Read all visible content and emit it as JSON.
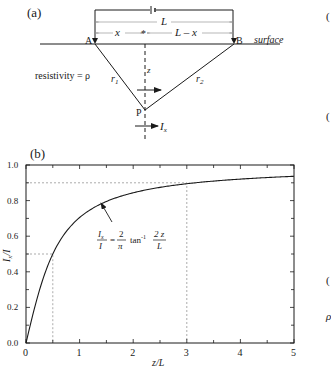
{
  "panel_a": {
    "label": "(a)",
    "L_label": "L",
    "x_label": "x",
    "Lx_label": "L – x",
    "A_label": "A",
    "B_label": "B",
    "surface_label": "surface",
    "resistivity_label": "resistivity = ρ",
    "r1_label": "r",
    "r1_sub": "1",
    "r2_label": "r",
    "r2_sub": "2",
    "z_label": "z",
    "P_label": "P",
    "Ix_label": "I",
    "Ix_sub": "x"
  },
  "panel_b": {
    "label": "(b)",
    "equation": {
      "lhs_num": "I",
      "lhs_num_sub": "x",
      "lhs_den": "I",
      "eq": "=",
      "coef_num": "2",
      "coef_den": "π",
      "func": "tan",
      "sup": "-1",
      "arg_num": "2 z",
      "arg_den": "L"
    }
  },
  "chart_data": {
    "type": "line",
    "title": "",
    "xlabel": "z/L",
    "ylabel": "Ix/I",
    "xlim": [
      0,
      5
    ],
    "ylim": [
      0,
      1.0
    ],
    "xticks": [
      "0",
      "1",
      "2",
      "3",
      "4",
      "5"
    ],
    "yticks": [
      "0.0",
      "0.2",
      "0.4",
      "0.6",
      "0.8",
      "1.0"
    ],
    "grid": false,
    "series": [
      {
        "name": "Ix/I = (2/π) tan⁻¹(2z/L)",
        "x": [
          0,
          0.1,
          0.25,
          0.5,
          0.75,
          1.0,
          1.5,
          2.0,
          2.5,
          3.0,
          3.5,
          4.0,
          4.5,
          5.0
        ],
        "values": [
          0,
          0.126,
          0.295,
          0.5,
          0.626,
          0.705,
          0.795,
          0.844,
          0.874,
          0.894,
          0.91,
          0.921,
          0.93,
          0.937
        ]
      }
    ],
    "annotations": [
      {
        "type": "dotted-guide",
        "x": 0.5,
        "y": 0.5
      },
      {
        "type": "dotted-guide",
        "x": 3.0,
        "y": 0.9
      },
      {
        "type": "arrow-label",
        "text": "Ix/I = (2/π) tan⁻¹ 2z/L",
        "points_to_x": 1.4
      }
    ]
  }
}
